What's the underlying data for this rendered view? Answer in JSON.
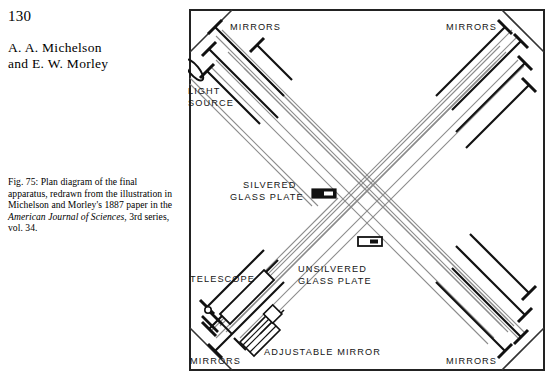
{
  "page": {
    "number": "130",
    "authors": "A. A. Michelson\nand E. W. Morley",
    "author_line_1": "A. A. Michelson",
    "author_line_2": "and E. W. Morley"
  },
  "caption": {
    "text_part_1": "Fig. 75: Plan diagram of the final apparatus, redrawn from the illustration in Michelson and Morley's 1887 paper in the ",
    "italic_1": "American Journal of Sciences",
    "text_part_2": ", 3rd series, vol. 34.",
    "figure_number": "Fig. 75"
  },
  "figure": {
    "labels": {
      "mirrors_top_left": "MIRRORS",
      "mirrors_top_right": "MIRRORS",
      "mirrors_bottom_left": "MIRRORS",
      "mirrors_bottom_right": "MIRRORS",
      "light_source_line1": "LIGHT",
      "light_source_line2": "SOURCE",
      "silvered_line1": "SILVERED",
      "silvered_line2": "GLASS PLATE",
      "unsilvered_line1": "UNSILVERED",
      "unsilvered_line2": "GLASS PLATE",
      "telescope": "TELESCOPE",
      "adjustable_mirror": "ADJUSTABLE MIRROR"
    },
    "components": {
      "light_source_icon": "lens-ellipse",
      "silvered_plate_icon": "filled-rectangle",
      "unsilvered_plate_icon": "outlined-rectangle",
      "mirror_icon": "t-shaped-mirror-mount",
      "telescope_icon": "telescope-tube",
      "adjustable_mirror_icon": "screw-adjust-mirror"
    },
    "counts": {
      "mirrors_top_left": 3,
      "mirrors_top_right": 4,
      "mirrors_bottom_left": 3,
      "mirrors_bottom_right": 4
    },
    "colors": {
      "frame": "#222222",
      "beam": "#8a8a8a",
      "ink": "#111111",
      "background": "#ffffff"
    }
  }
}
